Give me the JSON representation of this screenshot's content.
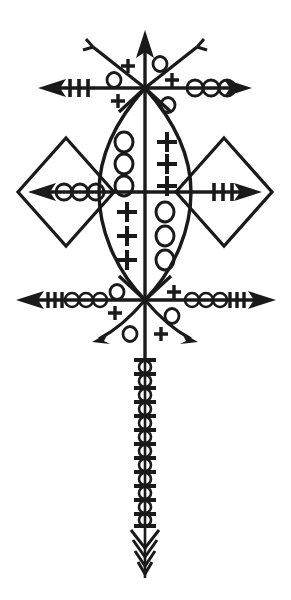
{
  "image": {
    "title": "Vodou Veve Sigil",
    "description": "Symmetrical ritual veve drawing composed of a vertical axis, two horizontal crossbars, diagonal rays, a central vesica (lens) shape, two side diamonds and a long beaded bottom shaft.",
    "width": 291,
    "height": 600,
    "background_color": "#ffffff",
    "ink_color": "#1a1a1a"
  },
  "symbols": {
    "cross": "+",
    "circle": "o",
    "hash_mark": "|",
    "arrowhead": "arrowhead",
    "fork_tip": "two-pronged-fork"
  },
  "structure": {
    "vertical_axis": {
      "name": "central-vertical-axis",
      "top_y": 32,
      "bottom_y": 575,
      "x": 145,
      "top_terminal": "arrowhead-up",
      "bottom_terminal": "feathered-arrowhead-down"
    },
    "top_crossbar": {
      "name": "top-crossbar",
      "y": 88,
      "left_x": 38,
      "right_x": 252,
      "left_arm": {
        "terminal": "arrowhead-left",
        "marks": [
          {
            "type": "hash_mark",
            "count": 3
          }
        ]
      },
      "right_arm": {
        "terminal": "arrowhead-right",
        "marks": [
          {
            "type": "circle",
            "count": 3
          }
        ]
      }
    },
    "middle_crossbar": {
      "name": "middle-crossbar",
      "y": 192,
      "left_x": 28,
      "right_x": 262,
      "left_arm": {
        "terminal": "arrowhead-left",
        "marks": [
          {
            "type": "circle",
            "count": 3
          }
        ],
        "enclosure": "diamond"
      },
      "right_arm": {
        "terminal": "arrowhead-right",
        "marks": [
          {
            "type": "hash_mark",
            "count": 3
          }
        ],
        "enclosure": "diamond"
      }
    },
    "bottom_crossbar": {
      "name": "bottom-crossbar",
      "y": 300,
      "left_x": 16,
      "right_x": 276,
      "left_arm": {
        "terminal": "arrowhead-left",
        "marks": [
          {
            "type": "hash_mark",
            "count": 3
          },
          {
            "type": "circle",
            "count": 3
          }
        ]
      },
      "right_arm": {
        "terminal": "arrowhead-right",
        "marks": [
          {
            "type": "hash_mark",
            "count": 3
          },
          {
            "type": "circle",
            "count": 3
          }
        ]
      }
    },
    "top_diagonals": {
      "name": "top-diagonal-rays",
      "origin": {
        "x": 145,
        "y": 88
      },
      "rays": [
        {
          "direction": "upper-left",
          "terminal": "two-pronged-fork",
          "end": {
            "x": 92,
            "y": 46
          }
        },
        {
          "direction": "upper-right",
          "terminal": "two-pronged-fork",
          "end": {
            "x": 198,
            "y": 46
          }
        },
        {
          "direction": "lower-left",
          "terminal": "none",
          "end": {
            "x": 118,
            "y": 112
          }
        },
        {
          "direction": "lower-right",
          "terminal": "none",
          "end": {
            "x": 172,
            "y": 112
          }
        }
      ]
    },
    "bottom_diagonals": {
      "name": "bottom-diagonal-rays",
      "origin": {
        "x": 145,
        "y": 300
      },
      "rays": [
        {
          "direction": "upper-left",
          "terminal": "none",
          "end": {
            "x": 118,
            "y": 276
          }
        },
        {
          "direction": "upper-right",
          "terminal": "none",
          "end": {
            "x": 172,
            "y": 276
          }
        },
        {
          "direction": "lower-left",
          "terminal": "arrowhead",
          "end": {
            "x": 92,
            "y": 342
          }
        },
        {
          "direction": "lower-right",
          "terminal": "arrowhead",
          "end": {
            "x": 198,
            "y": 342
          }
        }
      ]
    },
    "vesica": {
      "name": "central-vesica-lens",
      "top": {
        "x": 145,
        "y": 88
      },
      "bottom": {
        "x": 145,
        "y": 300
      },
      "left_x": 99,
      "right_x": 191,
      "quadrants": [
        {
          "position": "upper-left",
          "symbol": "circle",
          "count": 3
        },
        {
          "position": "upper-right",
          "symbol": "cross",
          "count": 3
        },
        {
          "position": "lower-left",
          "symbol": "cross",
          "count": 3
        },
        {
          "position": "lower-right",
          "symbol": "circle",
          "count": 3
        }
      ]
    },
    "diamonds": [
      {
        "name": "left-diamond",
        "center_x": 66,
        "center_y": 192,
        "half_width": 48,
        "half_height": 54
      },
      {
        "name": "right-diamond",
        "center_x": 224,
        "center_y": 192,
        "half_width": 48,
        "half_height": 54
      }
    ],
    "bottom_shaft": {
      "name": "bottom-beaded-shaft",
      "x": 145,
      "start_y": 358,
      "end_y": 522,
      "pattern": "alternating horizontal bar and circle",
      "bar_count": 13,
      "circle_count": 12,
      "terminal": "feathered-arrowhead-down",
      "feather_count": 4
    },
    "top_node_marks": [
      {
        "name": "top-node-mark-upper-left",
        "symbol": "cross",
        "x": 128,
        "y": 66
      },
      {
        "name": "top-node-mark-upper-right",
        "symbol": "circle",
        "x": 160,
        "y": 64
      },
      {
        "name": "top-node-mark-left",
        "symbol": "circle",
        "x": 114,
        "y": 80
      },
      {
        "name": "top-node-mark-right",
        "symbol": "cross",
        "x": 172,
        "y": 80
      },
      {
        "name": "top-node-mark-lower-left",
        "symbol": "cross",
        "x": 118,
        "y": 99
      },
      {
        "name": "top-node-mark-lower-right",
        "symbol": "circle",
        "x": 168,
        "y": 104
      }
    ],
    "bottom_node_marks": [
      {
        "name": "bottom-node-mark-upper-left",
        "symbol": "circle",
        "x": 117,
        "y": 292
      },
      {
        "name": "bottom-node-mark-upper-right",
        "symbol": "cross",
        "x": 174,
        "y": 292
      },
      {
        "name": "bottom-node-mark-left",
        "symbol": "cross",
        "x": 115,
        "y": 312
      },
      {
        "name": "bottom-node-mark-right",
        "symbol": "circle",
        "x": 172,
        "y": 315
      },
      {
        "name": "bottom-node-mark-lower-left",
        "symbol": "circle",
        "x": 130,
        "y": 333
      },
      {
        "name": "bottom-node-mark-lower-right",
        "symbol": "cross",
        "x": 161,
        "y": 333
      }
    ]
  }
}
